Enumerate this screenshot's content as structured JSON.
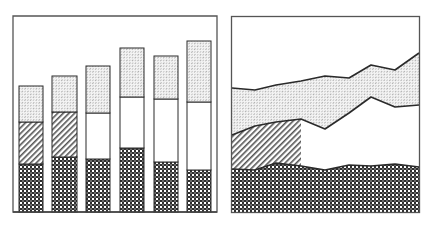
{
  "chart_data": [
    {
      "type": "bar",
      "stacked": true,
      "title": "",
      "xlabel": "",
      "ylabel": "",
      "categories": [
        "1",
        "2",
        "3",
        "4",
        "5",
        "6"
      ],
      "series": [
        {
          "name": "bottom (cross-hatch)",
          "pattern": "checker",
          "values": [
            48,
            55,
            53,
            64,
            50,
            42
          ]
        },
        {
          "name": "middle (diagonal hatch / blank)",
          "pattern": [
            "diagonal",
            "diagonal",
            "blank",
            "blank",
            "blank",
            "blank"
          ],
          "values": [
            42,
            45,
            46,
            51,
            63,
            68
          ]
        },
        {
          "name": "top (light dotted)",
          "pattern": "dotted",
          "values": [
            36,
            36,
            47,
            49,
            43,
            61
          ]
        }
      ],
      "ylim": [
        0,
        196
      ],
      "grid": false,
      "legend": "none"
    },
    {
      "type": "area",
      "stacked": true,
      "title": "",
      "xlabel": "",
      "ylabel": "",
      "x": [
        0,
        1,
        2,
        3,
        4,
        5,
        6,
        7,
        8
      ],
      "series": [
        {
          "name": "bottom (cross-hatch)",
          "pattern": "checker",
          "values": [
            43,
            42,
            49,
            46,
            42,
            47,
            46,
            48,
            45
          ]
        },
        {
          "name": "middle (diagonal hatch to x=3, then blank)",
          "pattern": "diagonal-then-blank",
          "values": [
            34,
            44,
            41,
            47,
            41,
            52,
            69,
            57,
            62
          ]
        },
        {
          "name": "top (light dotted)",
          "pattern": "dotted",
          "values": [
            47,
            36,
            37,
            38,
            53,
            35,
            32,
            37,
            52
          ]
        }
      ],
      "ylim": [
        0,
        195
      ],
      "grid": false,
      "legend": "none"
    }
  ],
  "bars": [
    {
      "x": 19,
      "w": 24,
      "top": 86,
      "mid": 122,
      "bot": 164,
      "mid_pattern": "diag"
    },
    {
      "x": 52,
      "w": 25,
      "top": 76,
      "mid": 112,
      "bot": 157,
      "mid_pattern": "diag"
    },
    {
      "x": 86,
      "w": 24,
      "top": 66,
      "mid": 113,
      "bot": 159,
      "mid_pattern": "blank"
    },
    {
      "x": 120,
      "w": 24,
      "top": 48,
      "mid": 97,
      "bot": 148,
      "mid_pattern": "blank"
    },
    {
      "x": 154,
      "w": 24,
      "top": 56,
      "mid": 99,
      "bot": 162,
      "mid_pattern": "blank"
    },
    {
      "x": 187,
      "w": 24,
      "top": 41,
      "mid": 102,
      "bot": 170,
      "mid_pattern": "blank"
    }
  ],
  "area": {
    "xs": [
      232,
      255,
      276,
      301,
      325,
      349,
      371,
      395,
      419
    ],
    "top": [
      88,
      90,
      85,
      81,
      76,
      78,
      65,
      70,
      53
    ],
    "mid": [
      135,
      126,
      122,
      119,
      129,
      113,
      97,
      107,
      105
    ],
    "bot": [
      169,
      170,
      163,
      166,
      170,
      165,
      166,
      164,
      167
    ],
    "hatch_end_index": 3
  },
  "colors": {
    "stroke": "#2a2a2a",
    "frame": "#555555",
    "fill_dark": "#333333",
    "fill_light": "#bbbbbb",
    "background": "#ffffff"
  }
}
